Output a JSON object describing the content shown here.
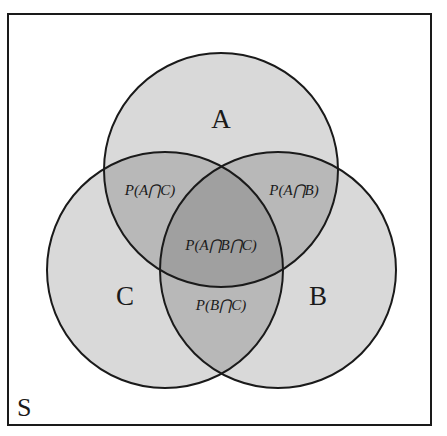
{
  "diagram": {
    "type": "venn-3-set",
    "universe": {
      "label": "S",
      "box": {
        "x": 8,
        "y": 14,
        "width": 423,
        "height": 411
      }
    },
    "sets": [
      {
        "id": "A",
        "label": "A",
        "cx": 221,
        "cy": 170,
        "r": 117,
        "label_x": 221,
        "label_y": 128
      },
      {
        "id": "B",
        "label": "B",
        "cx": 278,
        "cy": 270,
        "r": 118,
        "label_x": 318,
        "label_y": 305
      },
      {
        "id": "C",
        "label": "C",
        "cx": 165,
        "cy": 270,
        "r": 118,
        "label_x": 125,
        "label_y": 305
      }
    ],
    "regions": [
      {
        "id": "A_and_C",
        "label": "P(A⋂C)",
        "x": 150,
        "y": 195
      },
      {
        "id": "A_and_B",
        "label": "P(A⋂B)",
        "x": 294,
        "y": 195
      },
      {
        "id": "A_and_B_and_C",
        "label": "P(A⋂B⋂C)",
        "x": 221,
        "y": 250
      },
      {
        "id": "B_and_C",
        "label": "P(B⋂C)",
        "x": 221,
        "y": 310
      }
    ],
    "colors": {
      "border": "#1a1a1a",
      "single_region": "#d9d9d9",
      "double_overlap": "#b8b8b8",
      "triple_overlap": "#a0a0a0",
      "background": "#ffffff"
    }
  }
}
